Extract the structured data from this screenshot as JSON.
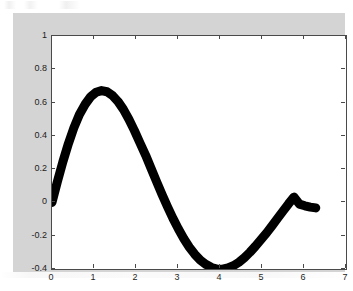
{
  "figure": {
    "background_color": "#d4d4d4",
    "page_color": "#ffffff",
    "axes_background": "#ffffff",
    "axes_border_color": "#4a4a4a",
    "line_color": "#000000"
  },
  "chart_data": {
    "type": "line",
    "title": "",
    "subtitle": "",
    "xlabel": "",
    "ylabel": "",
    "xlim": [
      0,
      7
    ],
    "ylim": [
      -0.4,
      1
    ],
    "xticks": [
      "0",
      "1",
      "2",
      "3",
      "4",
      "5",
      "6",
      "7"
    ],
    "xtick_values": [
      0,
      1,
      2,
      3,
      4,
      5,
      6,
      7
    ],
    "yticks": [
      "-0.4",
      "-0.2",
      "0",
      "0.2",
      "0.4",
      "0.6",
      "0.8",
      "1"
    ],
    "ytick_values": [
      -0.4,
      -0.2,
      0,
      0.2,
      0.4,
      0.6,
      0.8,
      1
    ],
    "grid": false,
    "legend": null,
    "legend_position": "none",
    "line_width_px": 9,
    "series": [
      {
        "name": "damped sine",
        "color": "#000000",
        "x": [
          0.0,
          0.13,
          0.26,
          0.39,
          0.52,
          0.65,
          0.79,
          0.92,
          1.05,
          1.18,
          1.31,
          1.44,
          1.57,
          1.7,
          1.83,
          1.96,
          2.09,
          2.23,
          2.36,
          2.49,
          2.62,
          2.75,
          2.88,
          3.01,
          3.14,
          3.27,
          3.4,
          3.53,
          3.67,
          3.8,
          3.93,
          4.06,
          4.19,
          4.32,
          4.45,
          4.58,
          4.71,
          4.84,
          4.97,
          5.11,
          5.24,
          5.37,
          5.5,
          5.63,
          5.76,
          5.89,
          6.02,
          6.15,
          6.28
        ],
        "y": [
          0.0,
          0.126,
          0.245,
          0.353,
          0.448,
          0.527,
          0.59,
          0.635,
          0.662,
          0.672,
          0.665,
          0.643,
          0.607,
          0.559,
          0.5,
          0.433,
          0.36,
          0.283,
          0.204,
          0.125,
          0.048,
          -0.026,
          -0.096,
          -0.16,
          -0.218,
          -0.269,
          -0.312,
          -0.347,
          -0.373,
          -0.391,
          -0.4,
          -0.401,
          -0.394,
          -0.38,
          -0.359,
          -0.332,
          -0.3,
          -0.264,
          -0.225,
          -0.183,
          -0.14,
          -0.096,
          -0.052,
          -0.009,
          0.032,
          -0.01,
          -0.02,
          -0.028,
          -0.033
        ]
      }
    ],
    "annotations": [],
    "peak": {
      "x": 1.35,
      "y": 0.75
    },
    "minimum": {
      "x": 4.5,
      "y": -0.4
    },
    "start_point": {
      "x": 0,
      "y": 0
    },
    "end_point": {
      "x": 6.28,
      "y": -0.03
    }
  }
}
